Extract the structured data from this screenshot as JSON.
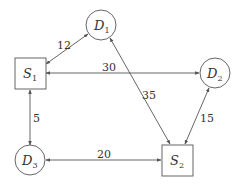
{
  "diagram": {
    "nodes": [
      {
        "id": "S1",
        "letter": "S",
        "sub": "1",
        "shape": "square"
      },
      {
        "id": "S2",
        "letter": "S",
        "sub": "2",
        "shape": "square"
      },
      {
        "id": "D1",
        "letter": "D",
        "sub": "1",
        "shape": "circle"
      },
      {
        "id": "D2",
        "letter": "D",
        "sub": "2",
        "shape": "circle"
      },
      {
        "id": "D3",
        "letter": "D",
        "sub": "3",
        "shape": "circle"
      }
    ],
    "edges": [
      {
        "from": "S1",
        "to": "D1",
        "weight": "12",
        "bidirectional": true
      },
      {
        "from": "S1",
        "to": "D2",
        "weight": "30",
        "bidirectional": true
      },
      {
        "from": "S1",
        "to": "D3",
        "weight": "5",
        "bidirectional": true
      },
      {
        "from": "D1",
        "to": "S2",
        "weight": "35",
        "bidirectional": true
      },
      {
        "from": "D2",
        "to": "S2",
        "weight": "15",
        "bidirectional": true
      },
      {
        "from": "D3",
        "to": "S2",
        "weight": "20",
        "bidirectional": true
      }
    ]
  }
}
